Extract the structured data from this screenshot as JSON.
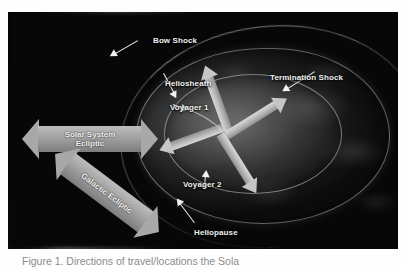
{
  "figure": {
    "alt_title": "Heliosphere structure diagram",
    "labels": {
      "bow_shock": "Bow Shock",
      "heliosheath": "Heliosheath",
      "voyager_1": "Voyager 1",
      "voyager_2": "Voyager 2",
      "termination_shock": "Termination Shock",
      "heliopause": "Heliopause"
    },
    "ecliptic_arrows": [
      {
        "id": "solar-system-ecliptic",
        "line1": "Solar System",
        "line2": "Ecliptic"
      },
      {
        "id": "galactic-ecliptic",
        "line1": "Galactic Ecliptic",
        "line2": ""
      }
    ],
    "colors": {
      "label_text": "#f0f0f0",
      "arrow_gray": "#a8a8a8",
      "solar_wind_arrow": "#c6c6c6",
      "pointer_white": "#f2f2f2",
      "background": "#060606",
      "caption_text": "#8c8c8c"
    }
  },
  "caption": {
    "text": "Figure 1. Directions of travel/locations the Sola"
  }
}
